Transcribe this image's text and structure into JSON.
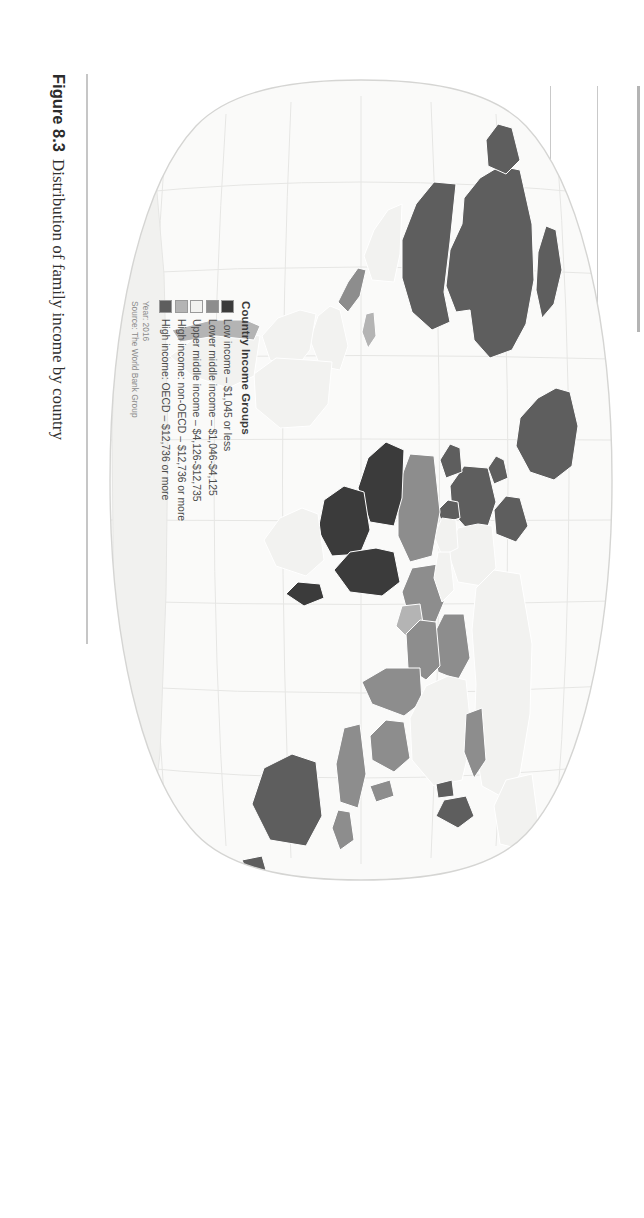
{
  "figure": {
    "number": "Figure 8.3",
    "caption": "Distribution of family income by country"
  },
  "legend": {
    "title": "Country Income Groups",
    "items": [
      {
        "label": "Low income – $1,045 or less",
        "color": "#3b3b3b"
      },
      {
        "label": "Lower middle income – $1,046-$4,125",
        "color": "#8d8d8d"
      },
      {
        "label": "Upper middle income – $4,126-$12,735",
        "color": "#f2f2f0"
      },
      {
        "label": "High income: non-OECD – $12,736 or more",
        "color": "#b4b4b4"
      },
      {
        "label": "High income: OECD – $12,736 or more",
        "color": "#5e5e5e"
      }
    ],
    "year": "Year: 2016",
    "source": "Source: The World Bank Group"
  },
  "map": {
    "type": "choropleth",
    "projection": "robinson-oval",
    "ocean_color": "#ffffff",
    "land_default": "#f1f1ef",
    "graticule_color": "#e3e3e1",
    "outline_color": "#d8d8d6",
    "regions": [
      {
        "name": "canada",
        "group": "High income: OECD"
      },
      {
        "name": "united-states",
        "group": "High income: OECD"
      },
      {
        "name": "greenland",
        "group": "High income: OECD"
      },
      {
        "name": "mexico",
        "group": "Upper middle income"
      },
      {
        "name": "central-america",
        "group": "Lower middle income"
      },
      {
        "name": "brazil",
        "group": "Upper middle income"
      },
      {
        "name": "argentina",
        "group": "Upper middle income"
      },
      {
        "name": "chile",
        "group": "High income: non-OECD"
      },
      {
        "name": "colombia",
        "group": "Upper middle income"
      },
      {
        "name": "peru-bolivia",
        "group": "Upper middle income"
      },
      {
        "name": "venezuela",
        "group": "Upper middle income"
      },
      {
        "name": "western-europe",
        "group": "High income: OECD"
      },
      {
        "name": "eastern-europe",
        "group": "Upper middle income"
      },
      {
        "name": "russia",
        "group": "Upper middle income"
      },
      {
        "name": "north-africa",
        "group": "Lower middle income"
      },
      {
        "name": "sahel",
        "group": "Low income"
      },
      {
        "name": "west-africa",
        "group": "Low income"
      },
      {
        "name": "central-africa",
        "group": "Low income"
      },
      {
        "name": "east-africa",
        "group": "Low income"
      },
      {
        "name": "southern-africa",
        "group": "Upper middle income"
      },
      {
        "name": "gulf-states",
        "group": "High income: non-OECD"
      },
      {
        "name": "middle-east",
        "group": "Lower middle income"
      },
      {
        "name": "india",
        "group": "Lower middle income"
      },
      {
        "name": "china",
        "group": "Upper middle income"
      },
      {
        "name": "mongolia",
        "group": "Lower middle income"
      },
      {
        "name": "southeast-asia",
        "group": "Lower middle income"
      },
      {
        "name": "japan-korea",
        "group": "High income: OECD"
      },
      {
        "name": "australia",
        "group": "High income: OECD"
      },
      {
        "name": "new-zealand",
        "group": "High income: OECD"
      },
      {
        "name": "indonesia",
        "group": "Lower middle income"
      },
      {
        "name": "antarctica",
        "group": "unclassified"
      }
    ]
  }
}
